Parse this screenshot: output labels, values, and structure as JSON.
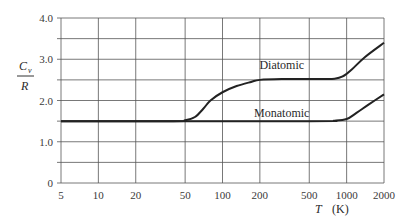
{
  "chart_data": {
    "type": "line",
    "title": "",
    "xlabel": "T (K)",
    "xlabel_italic": "T",
    "xlabel_unit": "(K)",
    "ylabel": "C_v / R",
    "ylabel_numerator": "C",
    "ylabel_subscript": "v",
    "ylabel_denominator": "R",
    "x_scale": "log",
    "xlim": [
      5,
      2000
    ],
    "ylim": [
      0,
      4.0
    ],
    "x_ticks": [
      5,
      10,
      20,
      50,
      100,
      200,
      500,
      1000,
      2000
    ],
    "x_tick_labels": [
      "5",
      "10",
      "20",
      "50",
      "100",
      "200",
      "500",
      "1000",
      "2000"
    ],
    "y_ticks": [
      0,
      1.0,
      2.0,
      3.0,
      4.0
    ],
    "y_tick_labels": [
      "0",
      "1.0",
      "2.0",
      "3.0",
      "4.0"
    ],
    "y_minor_gridlines": [
      0.5,
      1.5,
      2.5,
      3.5
    ],
    "grid": true,
    "legend": "inline labels",
    "series": [
      {
        "name": "Diatomic",
        "label_at": {
          "T": 300,
          "y": 2.85
        },
        "points": [
          {
            "T": 5,
            "y": 1.5
          },
          {
            "T": 40,
            "y": 1.5
          },
          {
            "T": 50,
            "y": 1.52
          },
          {
            "T": 60,
            "y": 1.6
          },
          {
            "T": 70,
            "y": 1.8
          },
          {
            "T": 80,
            "y": 2.0
          },
          {
            "T": 100,
            "y": 2.2
          },
          {
            "T": 130,
            "y": 2.35
          },
          {
            "T": 170,
            "y": 2.45
          },
          {
            "T": 200,
            "y": 2.5
          },
          {
            "T": 300,
            "y": 2.52
          },
          {
            "T": 500,
            "y": 2.52
          },
          {
            "T": 800,
            "y": 2.53
          },
          {
            "T": 950,
            "y": 2.6
          },
          {
            "T": 1100,
            "y": 2.75
          },
          {
            "T": 1400,
            "y": 3.05
          },
          {
            "T": 2000,
            "y": 3.4
          }
        ]
      },
      {
        "name": "Monatomic",
        "label_at": {
          "T": 300,
          "y": 1.7
        },
        "points": [
          {
            "T": 5,
            "y": 1.5
          },
          {
            "T": 500,
            "y": 1.5
          },
          {
            "T": 800,
            "y": 1.51
          },
          {
            "T": 1000,
            "y": 1.55
          },
          {
            "T": 1200,
            "y": 1.7
          },
          {
            "T": 1500,
            "y": 1.9
          },
          {
            "T": 2000,
            "y": 2.15
          }
        ]
      }
    ]
  }
}
